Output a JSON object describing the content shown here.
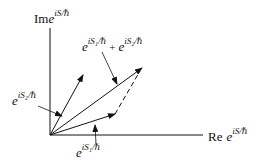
{
  "diagram": {
    "axes": {
      "y_label": {
        "prefix": "Im",
        "base": "e",
        "exponent": "iS/ℏ"
      },
      "x_label": {
        "prefix": "Re",
        "base": "e",
        "exponent": "iS/ℏ"
      }
    },
    "vectors": [
      {
        "name": "phasor-1",
        "label": {
          "base": "e",
          "exponent": "iS₁/ℏ"
        }
      },
      {
        "name": "phasor-2",
        "label": {
          "base": "e",
          "exponent": "iS₂/ℏ"
        }
      },
      {
        "name": "phasor-sum",
        "label": {
          "a_base": "e",
          "a_exp": "iS₁/ℏ",
          "op": "+",
          "b_base": "e",
          "b_exp": "iS₂/ℏ"
        }
      }
    ],
    "colors": {
      "ink": "#111111",
      "background": "#ffffff"
    }
  }
}
